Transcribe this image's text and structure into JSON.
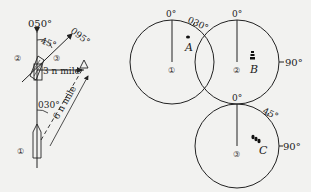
{
  "figure": {
    "type": "radar plotting / ship maneuvering diagram",
    "colors": {
      "ink": "#222222",
      "background": "#f2f2f0"
    }
  },
  "left_diagram": {
    "heading_label": "050°",
    "course_label": "095°",
    "angle_label": "45°",
    "bearing_label": "030°",
    "distance_long": "6 n mile",
    "distance_short": "3 n mile",
    "positions": [
      "①",
      "②",
      "③"
    ]
  },
  "radar_1": {
    "position": "①",
    "north_label": "0°",
    "bearing_label": "030°",
    "target_label": "A"
  },
  "radar_2": {
    "position": "②",
    "north_label": "0°",
    "beam_label": "90°",
    "target_label": "B"
  },
  "radar_3": {
    "position": "③",
    "north_label": "0°",
    "angle_label": "45°",
    "beam_label": "90°",
    "target_label": "C"
  }
}
